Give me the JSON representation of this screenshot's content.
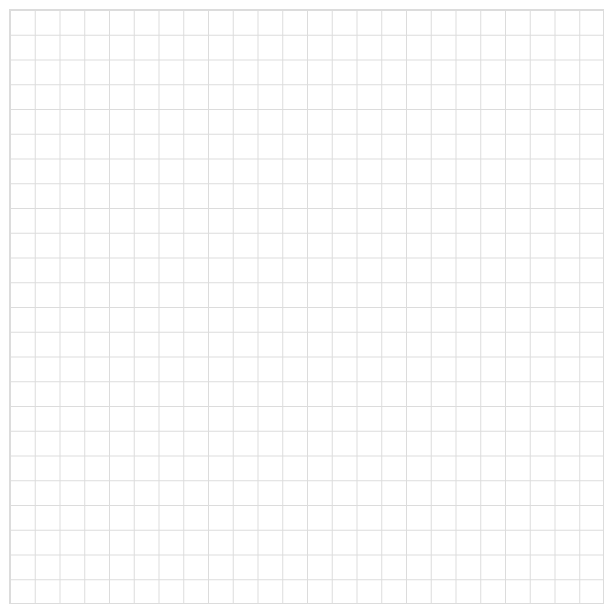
{
  "page": {
    "width": 612,
    "height": 613,
    "background_color": "#ffffff",
    "content_description": "blank square grid / graph paper",
    "text_content": "",
    "labels": [],
    "annotations": []
  },
  "grid": {
    "name": "square-grid",
    "origin_x": 9,
    "origin_y": 9,
    "width": 594,
    "height": 594,
    "columns": 24,
    "rows": 24,
    "cell_width": 24.75,
    "cell_height": 24.75,
    "line_color": "#dcdcdc",
    "line_width": 1,
    "background_color": "#ffffff",
    "major_gridlines": false,
    "axis_labels_visible": false,
    "tick_labels_visible": false
  },
  "chart_data": {
    "type": "table",
    "title": "",
    "subtitle": "",
    "xlabel": "",
    "ylabel": "",
    "categories": [],
    "values": [],
    "series": [],
    "xlim": [
      0,
      24
    ],
    "ylim": [
      0,
      24
    ],
    "grid": true,
    "legend": false,
    "legend_position": "none",
    "tick_labels_x": [],
    "tick_labels_y": [],
    "annotations": [],
    "note": "Empty graph-paper grid: 24 columns x 24 rows of uniform square cells, no plotted data, no text."
  }
}
